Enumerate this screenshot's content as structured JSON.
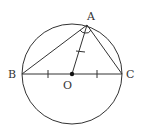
{
  "diagram": {
    "colors": {
      "stroke": "#333333",
      "background": "#ffffff"
    },
    "circle": {
      "center": "O",
      "cx": 72,
      "cy": 74,
      "r": 50
    },
    "points": {
      "A": {
        "label": "A",
        "x": 87,
        "y": 25
      },
      "B": {
        "label": "B",
        "x": 22,
        "y": 74
      },
      "C": {
        "label": "C",
        "x": 122,
        "y": 74
      },
      "O": {
        "label": "O",
        "x": 72,
        "y": 74
      }
    },
    "segments": [
      "AB",
      "AC",
      "BC",
      "AO"
    ],
    "marks": {
      "equal_ticks": [
        "BO",
        "OC",
        "AO"
      ],
      "angle_marks": [
        "BAO",
        "OAC"
      ]
    }
  }
}
